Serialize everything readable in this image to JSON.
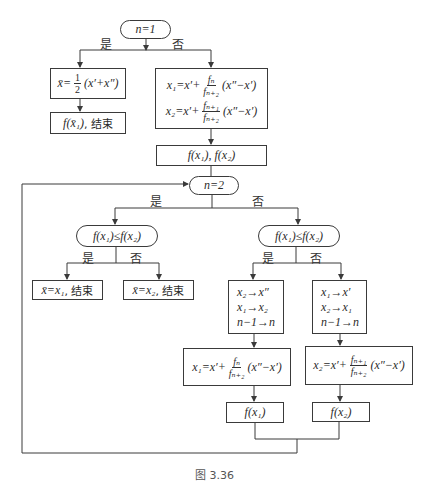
{
  "diagram": {
    "start_decision": {
      "label": "n=1",
      "yes_label": "是",
      "no_label": "否"
    },
    "left_branch": {
      "midpoint_box": {
        "lhs": "x̄=",
        "frac_num": "1",
        "frac_den": "2",
        "rhs": "(x′+x″)"
      },
      "end_box": {
        "expr": "f(x̄₁)",
        "suffix": ", 结束"
      }
    },
    "right_branch": {
      "init_box": {
        "line1": {
          "lhs": "x₁=x′+",
          "frac_num": "fₙ",
          "frac_den": "fₙ₊₂",
          "rhs": "(x″−x′)"
        },
        "line2": {
          "lhs": "x₂=x′+",
          "frac_num": "fₙ₊₁",
          "frac_den": "fₙ₊₂",
          "rhs": "(x″−x′)"
        }
      },
      "eval_box": {
        "label": "f(x₁), f(x₂)"
      }
    },
    "loop_decision": {
      "label": "n=2",
      "yes_label": "是",
      "no_label": "否"
    },
    "final_compare": {
      "label": "f(x₁)≤f(x₂)",
      "yes_label": "是",
      "no_label": "否",
      "yes_box": {
        "expr": "x̄=x₁",
        "suffix": ", 结束"
      },
      "no_box": {
        "expr": "x̄=x₂",
        "suffix": ", 结束"
      }
    },
    "iter_compare": {
      "label": "f(x₁)≤f(x₂)",
      "yes_label": "是",
      "no_label": "否",
      "yes_update": {
        "lines": [
          "x₂→x″",
          "x₁→x₂",
          "n−1→n"
        ],
        "formula": {
          "lhs": "x₁=x′+",
          "frac_num": "fₙ",
          "frac_den": "fₙ₊₂",
          "rhs": "(x″−x′)"
        },
        "eval": "f(x₁)"
      },
      "no_update": {
        "lines": [
          "x₁→x′",
          "x₂→x₁",
          "n−1→n"
        ],
        "formula": {
          "lhs": "x₂=x′+",
          "frac_num": "fₙ₊₁",
          "frac_den": "fₙ₊₂",
          "rhs": "(x″−x′)"
        },
        "eval": "f(x₂)"
      }
    },
    "caption": "图 3.36",
    "line_color": "#3a3a3a"
  }
}
